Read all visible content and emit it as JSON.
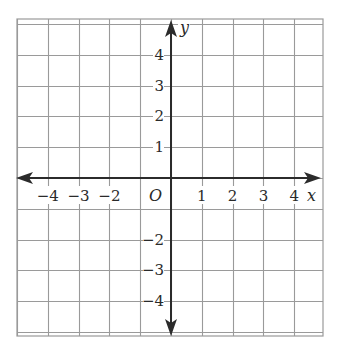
{
  "diagram": {
    "type": "coordinate-plane",
    "grid": {
      "x_min": -5,
      "x_max": 4.75,
      "y_min": -5,
      "y_max": 5,
      "cell_px": 30.8,
      "origin_px": [
        171,
        178
      ],
      "left_px": 17,
      "right_px": 323,
      "top_px": 19,
      "bottom_px": 336,
      "line_color": "#9a9a9a",
      "axis_color": "#2b2b2b"
    },
    "axes": {
      "x_label": "x",
      "y_label": "y",
      "origin_label": "O"
    },
    "x_tick_labels": [
      {
        "value": -4,
        "text": "−4"
      },
      {
        "value": -3,
        "text": "−3"
      },
      {
        "value": -2,
        "text": "−2"
      },
      {
        "value": 1,
        "text": "1"
      },
      {
        "value": 2,
        "text": "2"
      },
      {
        "value": 3,
        "text": "3"
      },
      {
        "value": 4,
        "text": "4"
      }
    ],
    "y_tick_labels": [
      {
        "value": 4,
        "text": "4"
      },
      {
        "value": 3,
        "text": "3"
      },
      {
        "value": 2,
        "text": "2"
      },
      {
        "value": 1,
        "text": "1"
      },
      {
        "value": -2,
        "text": "−2"
      },
      {
        "value": -3,
        "text": "−3"
      },
      {
        "value": -4,
        "text": "−4"
      }
    ]
  }
}
